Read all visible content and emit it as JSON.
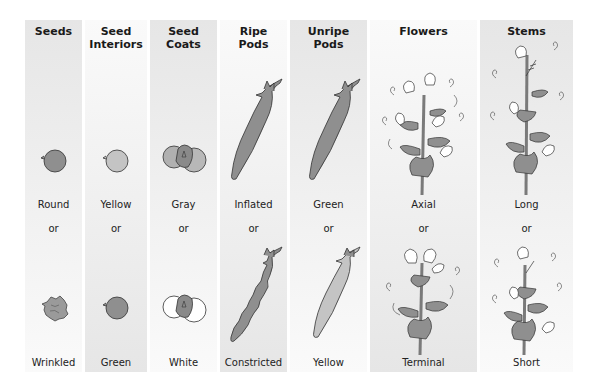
{
  "figure": {
    "columns": [
      {
        "key": "seeds",
        "header": "Seeds",
        "dominant": "Round",
        "or": "or",
        "recessive": "Wrinkled",
        "x": 0,
        "w": 57,
        "shade": "dark-top"
      },
      {
        "key": "seed-interiors",
        "header": "Seed\nInteriors",
        "dominant": "Yellow",
        "or": "or",
        "recessive": "Green",
        "x": 60,
        "w": 62,
        "shade": "light-top"
      },
      {
        "key": "seed-coats",
        "header": "Seed\nCoats",
        "dominant": "Gray",
        "or": "or",
        "recessive": "White",
        "x": 125,
        "w": 67,
        "shade": "dark-top"
      },
      {
        "key": "ripe-pods",
        "header": "Ripe\nPods",
        "dominant": "Inflated",
        "or": "or",
        "recessive": "Constricted",
        "x": 195,
        "w": 67,
        "shade": "light-top"
      },
      {
        "key": "unripe-pods",
        "header": "Unripe\nPods",
        "dominant": "Green",
        "or": "or",
        "recessive": "Yellow",
        "x": 265,
        "w": 77,
        "shade": "dark-top"
      },
      {
        "key": "flowers",
        "header": "Flowers",
        "dominant": "Axial",
        "or": "or",
        "recessive": "Terminal",
        "x": 345,
        "w": 107,
        "shade": "light-top"
      },
      {
        "key": "stems",
        "header": "Stems",
        "dominant": "Long",
        "or": "or",
        "recessive": "Short",
        "x": 455,
        "w": 93,
        "shade": "dark-top"
      }
    ]
  },
  "colors": {
    "green_fill": "#8f8f8f",
    "yellow_fill": "#c4c4c4",
    "white_fill": "#ffffff",
    "outline": "#333333",
    "band_dark": "#e6e6e6",
    "band_light": "#fafafa"
  },
  "icons": {
    "round-seed": "round-seed-icon",
    "wrinkled-seed": "wrinkled-seed-icon",
    "yellow-seed": "yellow-seed-icon",
    "green-seed": "green-seed-icon",
    "gray-coat": "gray-seed-coat-icon",
    "white-coat": "white-seed-coat-icon",
    "inflated-pod": "inflated-pod-icon",
    "constricted-pod": "constricted-pod-icon",
    "green-pod": "green-pod-icon",
    "yellow-pod": "yellow-pod-icon",
    "axial-flowers": "axial-flower-plant-icon",
    "terminal-flowers": "terminal-flower-plant-icon",
    "long-stem": "long-stem-plant-icon",
    "short-stem": "short-stem-plant-icon"
  }
}
